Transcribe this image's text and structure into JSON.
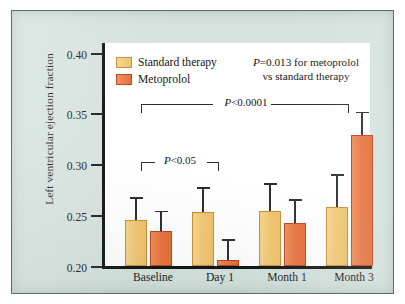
{
  "figure": {
    "background_color": "#d5e2dd",
    "plot_background_color": "#ffffff",
    "border_color": "#5c6b68"
  },
  "chart_data": {
    "type": "bar",
    "title": "",
    "subtitle": "",
    "xlabel": "",
    "ylabel": "Left ventricular ejection fraction",
    "categories": [
      "Baseline",
      "Day 1",
      "Month 1",
      "Month 3"
    ],
    "ylim": [
      0.2,
      0.4
    ],
    "ytick_labels": [
      "0.20",
      "0.25",
      "0.30",
      "0.35",
      "0.40"
    ],
    "ytick_values": [
      0.2,
      0.25,
      0.3,
      0.35,
      0.4
    ],
    "grid": false,
    "legend_position": "top-left",
    "series": [
      {
        "name": "Standard therapy",
        "color": "#f2c772",
        "border_color": "#c98b33",
        "values": [
          0.243,
          0.251,
          0.252,
          0.255
        ],
        "error_upper": [
          0.265,
          0.274,
          0.278,
          0.286
        ]
      },
      {
        "name": "Metoprolol",
        "color": "#e9713c",
        "border_color": "#b8431a",
        "values": [
          0.233,
          0.206,
          0.24,
          0.323
        ],
        "error_upper": [
          0.252,
          0.225,
          0.263,
          0.345
        ]
      }
    ],
    "annotations": [
      {
        "id": "pvalue-note",
        "line1": "P=0.013 for metoprolol",
        "line2": "vs standard therapy"
      },
      {
        "id": "bracket-overall",
        "label": "P<0.0001",
        "from": "Baseline",
        "to": "Month 3"
      },
      {
        "id": "bracket-day1",
        "label": "P<0.05",
        "from": "Baseline",
        "to": "Day 1"
      }
    ]
  }
}
